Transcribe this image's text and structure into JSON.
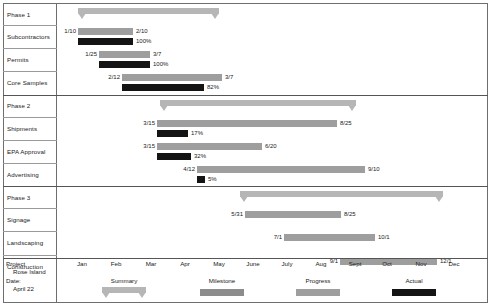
{
  "chart_data": {
    "type": "bar",
    "subtype": "gantt",
    "title": "",
    "xlabel": "",
    "ylabel": "",
    "grid": false,
    "legend_position": "bottom",
    "axis": {
      "tick_labels": [
        "Jan",
        "Feb",
        "Mar",
        "Apr",
        "May",
        "June",
        "July",
        "Aug",
        "Sept",
        "Oct",
        "Nov",
        "Dec"
      ],
      "tick_positions_px": [
        82,
        116,
        151,
        185,
        219,
        253,
        287,
        321,
        355,
        387,
        421,
        454
      ],
      "range": [
        "Jan",
        "Dec"
      ]
    },
    "legend": [
      {
        "name": "Summary",
        "color": "#b6b6b6",
        "shape": "summary-bar"
      },
      {
        "name": "Milestone",
        "color": "#8c8c8c",
        "shape": "bar"
      },
      {
        "name": "Progress",
        "color": "#9e9e9e",
        "shape": "bar"
      },
      {
        "name": "Actual",
        "color": "#141414",
        "shape": "bar"
      }
    ],
    "groups": [
      {
        "label": "Phase 1",
        "summary": {
          "start_px": 78,
          "end_px": 219
        },
        "tasks": [
          {
            "label": "Subcontractors",
            "start": "1/10",
            "end": "2/10",
            "planned": {
              "start_px": 78,
              "end_px": 133
            },
            "actual": {
              "start_px": 78,
              "end_px": 133
            },
            "percent": "100%"
          },
          {
            "label": "Permits",
            "start": "1/25",
            "end": "3/7",
            "planned": {
              "start_px": 99,
              "end_px": 150
            },
            "actual": {
              "start_px": 99,
              "end_px": 150
            },
            "percent": "100%"
          },
          {
            "label": "Core Samples",
            "start": "2/12",
            "end": "3/7",
            "planned": {
              "start_px": 122,
              "end_px": 222
            },
            "actual": {
              "start_px": 122,
              "end_px": 204
            },
            "percent": "82%"
          }
        ]
      },
      {
        "label": "Phase 2",
        "summary": {
          "start_px": 160,
          "end_px": 356
        },
        "tasks": [
          {
            "label": "Shipments",
            "start": "3/15",
            "end": "8/25",
            "planned": {
              "start_px": 157,
              "end_px": 337
            },
            "actual": {
              "start_px": 157,
              "end_px": 188
            },
            "percent": "17%"
          },
          {
            "label": "EPA Approval",
            "start": "3/15",
            "end": "6/20",
            "planned": {
              "start_px": 157,
              "end_px": 262
            },
            "actual": {
              "start_px": 157,
              "end_px": 191
            },
            "percent": "32%"
          },
          {
            "label": "Advertising",
            "start": "4/12",
            "end": "9/10",
            "planned": {
              "start_px": 197,
              "end_px": 365
            },
            "actual": {
              "start_px": 197,
              "end_px": 205
            },
            "percent": "5%"
          }
        ]
      },
      {
        "label": "Phase 3",
        "summary": {
          "start_px": 240,
          "end_px": 443
        },
        "tasks": [
          {
            "label": "Signage",
            "start": "5/31",
            "end": "8/25",
            "planned": {
              "start_px": 245,
              "end_px": 341
            },
            "actual": null,
            "percent": ""
          },
          {
            "label": "Landscaping",
            "start": "7/1",
            "end": "10/1",
            "planned": {
              "start_px": 284,
              "end_px": 375
            },
            "actual": null,
            "percent": ""
          },
          {
            "label": "Construction",
            "start": "9/1",
            "end": "12/1",
            "planned": {
              "start_px": 340,
              "end_px": 437
            },
            "actual": null,
            "percent": ""
          }
        ]
      }
    ]
  },
  "footer": {
    "project_caption": "Project",
    "project_name": "Rose Island",
    "date_caption": "Date:",
    "date_value": "April 22"
  }
}
